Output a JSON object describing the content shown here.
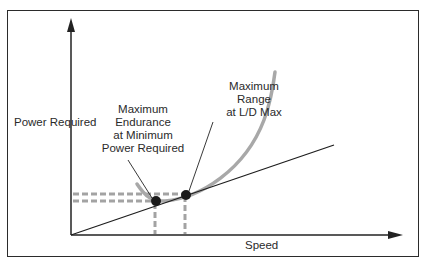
{
  "diagram": {
    "axes": {
      "y_label": "Power Required",
      "x_label": "Speed"
    },
    "annotations": {
      "max_endurance": {
        "lines": [
          "Maximum",
          "Endurance",
          "at Minimum",
          "Power Required"
        ]
      },
      "max_range": {
        "lines": [
          "Maximum",
          "Range",
          "at L/D Max"
        ]
      }
    },
    "elements": {
      "power_curve": "Power required curve (U-shaped, gray)",
      "tangent_line": "Line from origin tangent to curve",
      "point_min_power": "Minimum power required point",
      "point_ld_max": "L/D max tangent point"
    },
    "colors": {
      "curve": "#a8a8a8",
      "axes": "#222222",
      "dashes": "#a0a0a0",
      "points": "#1a1a1a"
    }
  }
}
